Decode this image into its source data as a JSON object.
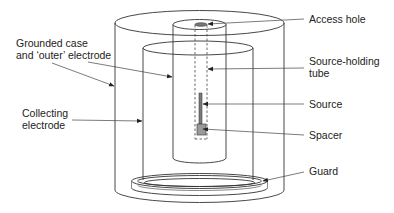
{
  "diagram": {
    "labels": {
      "grounded_case_line1": "Grounded case",
      "grounded_case_line2": "and ‘outer’ electrode",
      "collecting_line1": "Collecting",
      "collecting_line2": "electrode",
      "access_hole": "Access hole",
      "source_holding_line1": "Source-holding",
      "source_holding_line2": "tube",
      "source": "Source",
      "spacer": "Spacer",
      "guard": "Guard"
    },
    "colors": {
      "line": "#333333",
      "source_fill": "#7a7a7a",
      "spacer_fill": "#9a9a9a",
      "background": "#ffffff"
    }
  }
}
